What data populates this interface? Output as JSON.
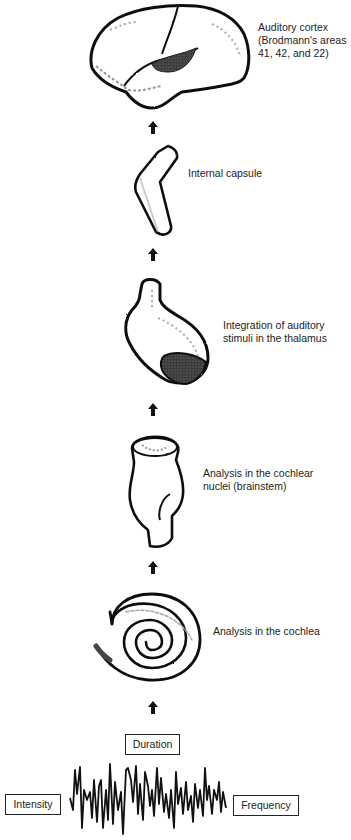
{
  "diagram": {
    "stages": [
      {
        "id": "cortex",
        "label_lines": [
          "Auditory cortex",
          "(Brodmann's areas",
          "41, 42, and 22)"
        ]
      },
      {
        "id": "capsule",
        "label_lines": [
          "Internal capsule"
        ]
      },
      {
        "id": "thalamus",
        "label_lines": [
          "Integration of auditory",
          "stimuli in the thalamus"
        ]
      },
      {
        "id": "nuclei",
        "label_lines": [
          "Analysis in the cochlear",
          "nuclei (brainstem)"
        ]
      },
      {
        "id": "cochlea",
        "label_lines": [
          "Analysis in the cochlea"
        ]
      }
    ],
    "sound_properties": {
      "duration": "Duration",
      "intensity": "Intensity",
      "frequency": "Frequency"
    },
    "arrow_icon": "up-arrow-icon",
    "colors": {
      "ink": "#1a1a1a",
      "shade": "#555555",
      "background": "#ffffff"
    }
  }
}
